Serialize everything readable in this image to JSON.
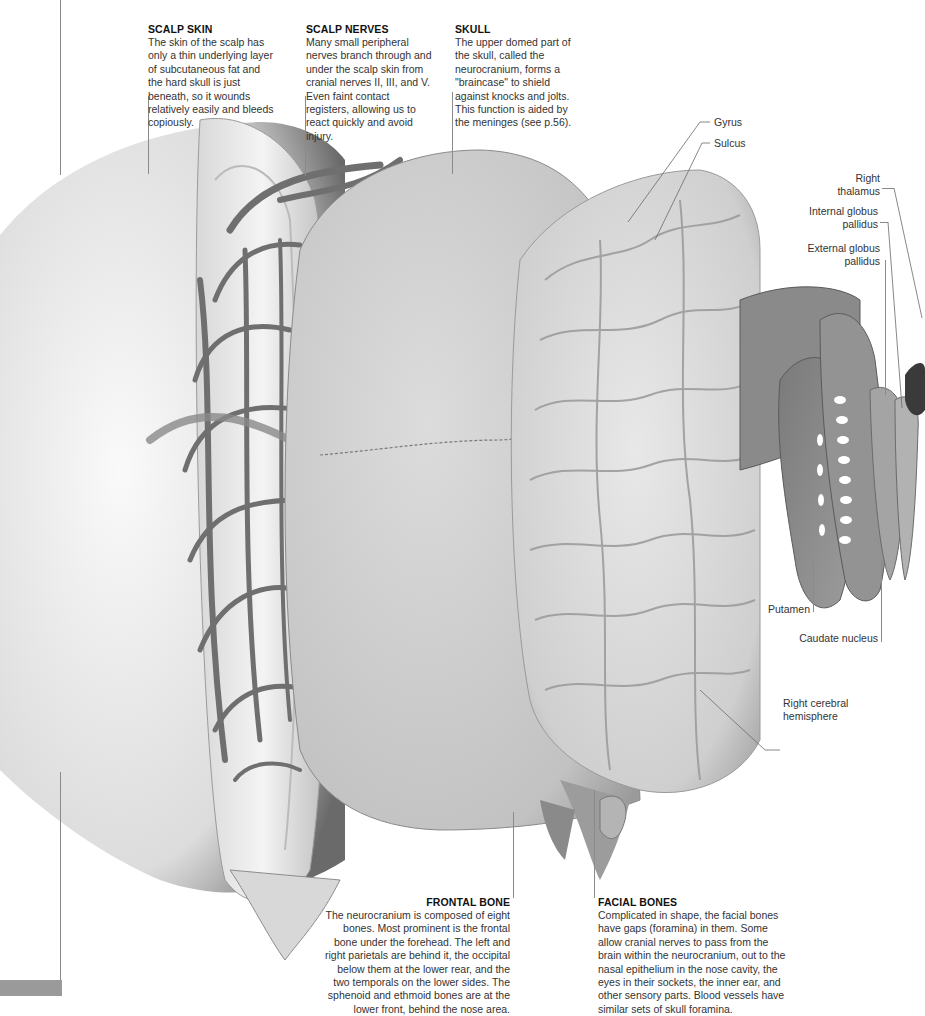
{
  "captions": {
    "scalp_skin": {
      "title": "SCALP SKIN",
      "body": "The skin of the scalp has only a thin underlying layer of subcutaneous fat and the hard skull is just beneath, so it wounds relatively easily and bleeds copiously."
    },
    "scalp_nerves": {
      "title": "SCALP NERVES",
      "body": "Many small peripheral nerves branch through and under the scalp skin from cranial nerves II, III, and V. Even faint contact registers, allowing us to react quickly and avoid injury."
    },
    "skull": {
      "title": "SKULL",
      "body": "The upper domed part of the skull, called the neurocranium, forms a \"braincase\" to shield against knocks and jolts. This function is aided by the meninges (see p.56)."
    },
    "frontal_bone": {
      "title": "FRONTAL BONE",
      "body": "The neurocranium is composed of eight bones. Most prominent is the frontal bone under the forehead. The left and right parietals are behind it, the occipital below them at the lower rear, and the two temporals on the lower sides. The sphenoid and ethmoid bones are at the lower front, behind the nose area."
    },
    "facial_bones": {
      "title": "FACIAL BONES",
      "body": "Complicated in shape, the facial bones have gaps (foramina) in them. Some allow cranial nerves to pass from the brain within the neurocranium, out to the nasal epithelium in the nose cavity, the eyes in their sockets, the inner ear, and other sensory parts. Blood vessels have similar sets of skull foramina."
    }
  },
  "labels": {
    "gyrus": "Gyrus",
    "sulcus": "Sulcus",
    "right_thalamus": "Right\nthalamus",
    "internal_globus_pallidus": "Internal globus\npallidus",
    "external_globus_pallidus": "External globus\npallidus",
    "putamen": "Putamen",
    "caudate_nucleus": "Caudate nucleus",
    "right_cerebral_hemisphere": "Right cerebral\nhemisphere"
  },
  "colors": {
    "background": "#ffffff",
    "leader_line": "#8a8a8a",
    "heading_text": "#111111",
    "body_text": "#333333"
  }
}
